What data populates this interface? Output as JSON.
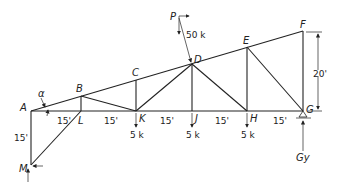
{
  "diagram": {
    "type": "truss",
    "nodes": {
      "A": {
        "label": "A"
      },
      "B": {
        "label": "B"
      },
      "C": {
        "label": "C"
      },
      "D": {
        "label": "D"
      },
      "E": {
        "label": "E"
      },
      "F": {
        "label": "F"
      },
      "G": {
        "label": "G"
      },
      "H": {
        "label": "H"
      },
      "J": {
        "label": "J"
      },
      "K": {
        "label": "K"
      },
      "L": {
        "label": "L"
      },
      "M": {
        "label": "M"
      }
    },
    "angle_label": "α",
    "load_P": {
      "label": "P",
      "value": "50 k"
    },
    "loads": [
      {
        "node": "K",
        "value": "5 k"
      },
      {
        "node": "J",
        "value": "5 k"
      },
      {
        "node": "H",
        "value": "5 k"
      }
    ],
    "panel_dims": [
      "15'",
      "15'",
      "15'",
      "15'",
      "15'",
      "15'"
    ],
    "height_dim": "20'",
    "vertical_dim_AM": "15'",
    "reaction_G": "Gy"
  }
}
